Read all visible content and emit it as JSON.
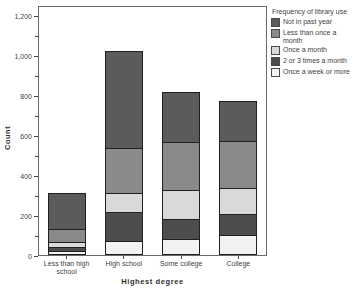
{
  "chart_data": {
    "type": "bar",
    "stacked": true,
    "title": "",
    "xlabel": "Highest degree",
    "ylabel": "Count",
    "ylim": [
      0,
      1250
    ],
    "yticks": [
      0,
      200,
      400,
      600,
      800,
      1000,
      1200
    ],
    "ytick_labels": [
      "0",
      "200",
      "400",
      "600",
      "800",
      "1,000",
      "1,200"
    ],
    "minor_ytick_interval": 100,
    "grid": false,
    "legend_title": "Frequency of library use",
    "legend_position": "right",
    "legend_order_top_to_bottom": [
      "Not in past year",
      "Less than once a month",
      "Once a month",
      "2 or 3 times a month",
      "Once a week or more"
    ],
    "categories": [
      "Less than high school",
      "High school",
      "Some college",
      "College"
    ],
    "series": [
      {
        "name": "Once a week or more",
        "color": "#f2f2f2",
        "values": [
          20,
          70,
          80,
          100
        ]
      },
      {
        "name": "2 or 3 times a month",
        "color": "#4d4d4d",
        "values": [
          25,
          150,
          105,
          110
        ]
      },
      {
        "name": "Once a month",
        "color": "#d9d9d9",
        "values": [
          30,
          100,
          150,
          135
        ]
      },
      {
        "name": "Less than once a month",
        "color": "#8a8a8a",
        "values": [
          70,
          230,
          245,
          240
        ]
      },
      {
        "name": "Not in past year",
        "color": "#5b5b5b",
        "values": [
          185,
          490,
          255,
          205
        ]
      }
    ],
    "totals": [
      330,
      1040,
      835,
      790
    ]
  },
  "colors": {
    "axis": "#4a4a4a",
    "text": "#3f3f3f",
    "segment_border": "#1f1f1f",
    "background": "#ffffff"
  }
}
